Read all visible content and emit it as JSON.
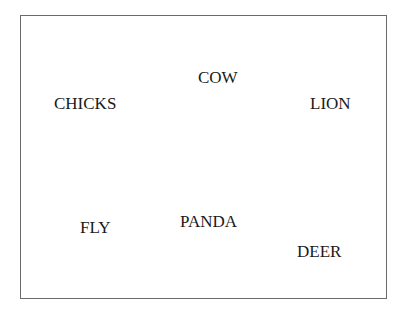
{
  "words": [
    {
      "label": "COW",
      "x": 198,
      "y": 69
    },
    {
      "label": "CHICKS",
      "x": 54,
      "y": 95
    },
    {
      "label": "LION",
      "x": 310,
      "y": 95
    },
    {
      "label": "FLY",
      "x": 80,
      "y": 219
    },
    {
      "label": "PANDA",
      "x": 180,
      "y": 213
    },
    {
      "label": "DEER",
      "x": 297,
      "y": 243
    }
  ]
}
